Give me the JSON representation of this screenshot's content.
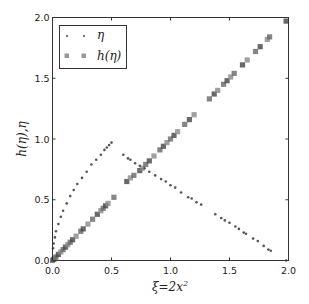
{
  "chart_data": {
    "type": "scatter",
    "title": "",
    "xlabel": "ξ = 2x²",
    "ylabel": "h(η), η",
    "xlim": [
      0.0,
      2.0
    ],
    "ylim": [
      0.0,
      2.0
    ],
    "xticks": [
      "0.0",
      "0.5",
      "1.0",
      "1.5",
      "2.0"
    ],
    "yticks": [
      "0.0",
      "0.5",
      "1.0",
      "1.5",
      "2.0"
    ],
    "grid": false,
    "legend_position": "upper left",
    "series": [
      {
        "name": "η",
        "marker": "dot",
        "color": "#555555",
        "points": [
          [
            0.0,
            0.0
          ],
          [
            0.005,
            0.1
          ],
          [
            0.01,
            0.14
          ],
          [
            0.02,
            0.19
          ],
          [
            0.03,
            0.24
          ],
          [
            0.05,
            0.3
          ],
          [
            0.07,
            0.36
          ],
          [
            0.09,
            0.41
          ],
          [
            0.12,
            0.47
          ],
          [
            0.15,
            0.53
          ],
          [
            0.18,
            0.58
          ],
          [
            0.21,
            0.63
          ],
          [
            0.25,
            0.68
          ],
          [
            0.29,
            0.73
          ],
          [
            0.33,
            0.79
          ],
          [
            0.37,
            0.83
          ],
          [
            0.41,
            0.87
          ],
          [
            0.44,
            0.91
          ],
          [
            0.46,
            0.93
          ],
          [
            0.48,
            0.95
          ],
          [
            0.5,
            0.97
          ],
          [
            0.6,
            0.87
          ],
          [
            0.64,
            0.84
          ],
          [
            0.66,
            0.83
          ],
          [
            0.7,
            0.8
          ],
          [
            0.74,
            0.78
          ],
          [
            0.78,
            0.76
          ],
          [
            0.82,
            0.73
          ],
          [
            0.87,
            0.7
          ],
          [
            0.92,
            0.67
          ],
          [
            0.96,
            0.65
          ],
          [
            1.0,
            0.62
          ],
          [
            1.04,
            0.6
          ],
          [
            1.09,
            0.56
          ],
          [
            1.15,
            0.52
          ],
          [
            1.18,
            0.51
          ],
          [
            1.22,
            0.48
          ],
          [
            1.26,
            0.46
          ],
          [
            1.38,
            0.38
          ],
          [
            1.43,
            0.35
          ],
          [
            1.46,
            0.33
          ],
          [
            1.5,
            0.31
          ],
          [
            1.55,
            0.28
          ],
          [
            1.58,
            0.26
          ],
          [
            1.62,
            0.23
          ],
          [
            1.64,
            0.22
          ],
          [
            1.7,
            0.18
          ],
          [
            1.74,
            0.16
          ],
          [
            1.79,
            0.12
          ],
          [
            1.83,
            0.09
          ],
          [
            1.85,
            0.08
          ],
          [
            1.98,
            0.0
          ]
        ]
      },
      {
        "name": "h(η)",
        "marker": "square",
        "color": "#777777",
        "points": [
          [
            0.0,
            0.0
          ],
          [
            0.01,
            0.01
          ],
          [
            0.02,
            0.02
          ],
          [
            0.03,
            0.03
          ],
          [
            0.05,
            0.05
          ],
          [
            0.07,
            0.07
          ],
          [
            0.09,
            0.09
          ],
          [
            0.11,
            0.11
          ],
          [
            0.13,
            0.13
          ],
          [
            0.15,
            0.15
          ],
          [
            0.17,
            0.17
          ],
          [
            0.2,
            0.2
          ],
          [
            0.24,
            0.24
          ],
          [
            0.26,
            0.26
          ],
          [
            0.3,
            0.3
          ],
          [
            0.34,
            0.34
          ],
          [
            0.38,
            0.38
          ],
          [
            0.41,
            0.41
          ],
          [
            0.43,
            0.43
          ],
          [
            0.45,
            0.45
          ],
          [
            0.47,
            0.47
          ],
          [
            0.52,
            0.52
          ],
          [
            0.63,
            0.65
          ],
          [
            0.66,
            0.68
          ],
          [
            0.69,
            0.7
          ],
          [
            0.74,
            0.74
          ],
          [
            0.76,
            0.76
          ],
          [
            0.79,
            0.79
          ],
          [
            0.82,
            0.82
          ],
          [
            0.86,
            0.86
          ],
          [
            0.91,
            0.91
          ],
          [
            0.94,
            0.94
          ],
          [
            0.97,
            0.97
          ],
          [
            1.0,
            1.0
          ],
          [
            1.03,
            1.03
          ],
          [
            1.06,
            1.06
          ],
          [
            1.12,
            1.12
          ],
          [
            1.16,
            1.16
          ],
          [
            1.2,
            1.2
          ],
          [
            1.33,
            1.33
          ],
          [
            1.37,
            1.37
          ],
          [
            1.4,
            1.4
          ],
          [
            1.45,
            1.45
          ],
          [
            1.48,
            1.48
          ],
          [
            1.51,
            1.51
          ],
          [
            1.54,
            1.54
          ],
          [
            1.61,
            1.61
          ],
          [
            1.65,
            1.65
          ],
          [
            1.72,
            1.72
          ],
          [
            1.76,
            1.76
          ],
          [
            1.82,
            1.82
          ],
          [
            1.84,
            1.84
          ],
          [
            1.98,
            1.97
          ]
        ]
      }
    ]
  },
  "legend": {
    "items": [
      {
        "label": "η"
      },
      {
        "label": "h(η)"
      }
    ]
  },
  "axes": {
    "xlabel_prefix": "ξ",
    "xlabel_eq": "=2x",
    "xlabel_sup": "2",
    "ylabel": "h(η),η"
  }
}
